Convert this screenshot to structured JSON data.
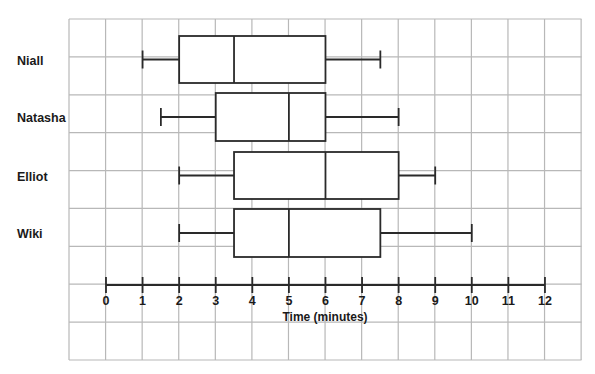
{
  "chart_data": {
    "type": "boxplot",
    "title": "",
    "xlabel": "Time (minutes)",
    "ylabel": "",
    "xlim": [
      0,
      12
    ],
    "x_ticks": [
      0,
      1,
      2,
      3,
      4,
      5,
      6,
      7,
      8,
      9,
      10,
      11,
      12
    ],
    "grid": true,
    "legend": null,
    "series": [
      {
        "name": "Niall",
        "min": 1,
        "q1": 2,
        "median": 3.5,
        "q3": 6,
        "max": 7.5
      },
      {
        "name": "Natasha",
        "min": 1.5,
        "q1": 3,
        "median": 5,
        "q3": 6,
        "max": 8
      },
      {
        "name": "Elliot",
        "min": 2,
        "q1": 3.5,
        "median": 6,
        "q3": 8,
        "max": 9
      },
      {
        "name": "Wiki",
        "min": 2,
        "q1": 3.5,
        "median": 5,
        "q3": 7.5,
        "max": 10
      }
    ]
  },
  "colors": {
    "grid": "#b8b8b8",
    "stroke": "#2a2a2a",
    "text": "#1a1a1a",
    "background": "#ffffff"
  }
}
